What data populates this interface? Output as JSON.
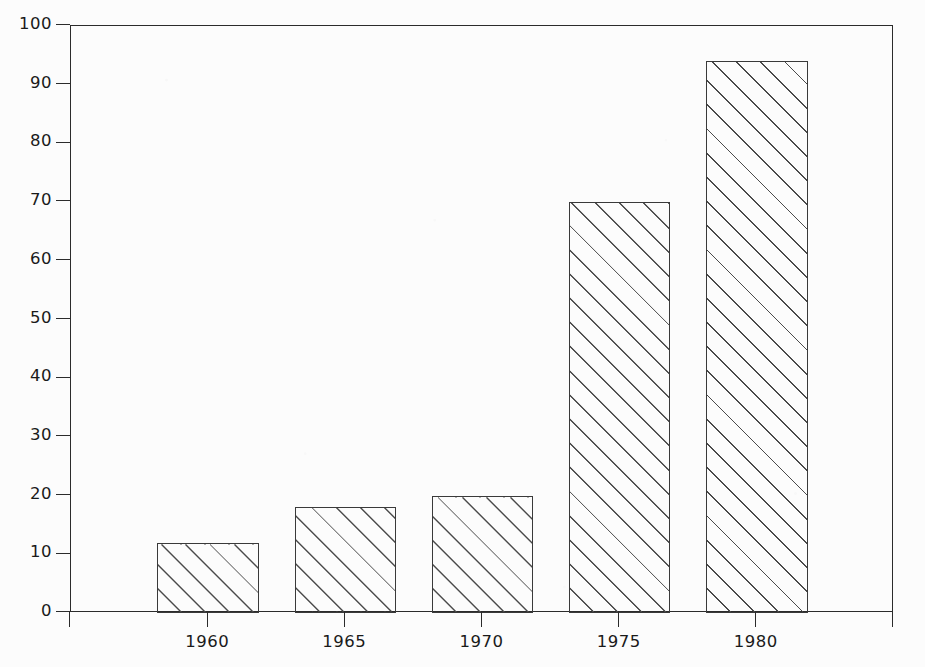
{
  "chart_data": {
    "type": "bar",
    "title": "",
    "subtitle": "",
    "xlabel": "",
    "ylabel": "",
    "categories": [
      "1960",
      "1965",
      "1970",
      "1975",
      "1980"
    ],
    "values": [
      12,
      18,
      20,
      70,
      94
    ],
    "series": [
      {
        "name": "",
        "values": [
          12,
          18,
          20,
          70,
          94
        ]
      }
    ],
    "ylim": [
      0,
      100
    ],
    "y_ticks": [
      0,
      10,
      20,
      30,
      40,
      50,
      60,
      70,
      80,
      90,
      100
    ],
    "y_tick_labels": [
      "0",
      "10",
      "20",
      "30",
      "40",
      "50",
      "60",
      "70",
      "80",
      "90",
      "100"
    ],
    "xlim": [
      1955,
      1985
    ],
    "x_ticks": [
      1955,
      1960,
      1965,
      1970,
      1975,
      1980,
      1985
    ],
    "x_tick_labels": [
      "",
      "1960",
      "1965",
      "1970",
      "1975",
      "1980",
      ""
    ],
    "grid": false,
    "legend": "none",
    "bar_fill": "diagonal-hatch-45",
    "bar_edge_color": "#3a3a3a",
    "hatch_color": "#4a4a4a",
    "background_color": "#fcfcfc",
    "axis_color": "#2b2b2b",
    "bar_width_years": 3.7
  },
  "bars": [
    {
      "label": "1960",
      "value": 12,
      "x_center": 1960
    },
    {
      "label": "1965",
      "value": 18,
      "x_center": 1965
    },
    {
      "label": "1970",
      "value": 20,
      "x_center": 1970
    },
    {
      "label": "1975",
      "value": 70,
      "x_center": 1975
    },
    {
      "label": "1980",
      "value": 94,
      "x_center": 1980
    }
  ]
}
